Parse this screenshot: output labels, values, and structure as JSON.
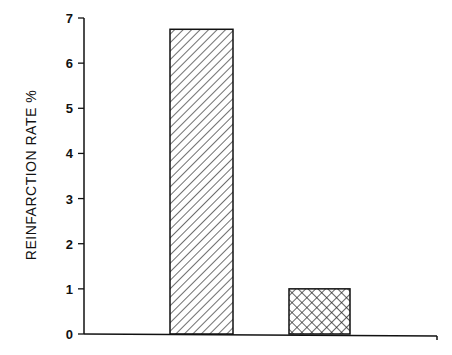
{
  "chart_data": {
    "type": "bar",
    "title": "",
    "xlabel": "",
    "ylabel": "REINFARCTION RATE %",
    "categories": [
      "Group 1",
      "Group 2"
    ],
    "values": [
      6.75,
      1.0
    ],
    "ylim": [
      0,
      7
    ],
    "yticks": [
      0,
      1,
      2,
      3,
      4,
      5,
      6,
      7
    ],
    "grid": false,
    "legend": null,
    "bar_patterns": [
      "diagonal-hatch",
      "crosshatch"
    ],
    "colors": {
      "stroke": "#111111",
      "fill": "#ffffff"
    }
  },
  "axis": {
    "ylabel": "REINFARCTION RATE %",
    "ticks": [
      "0",
      "1",
      "2",
      "3",
      "4",
      "5",
      "6",
      "7"
    ]
  }
}
